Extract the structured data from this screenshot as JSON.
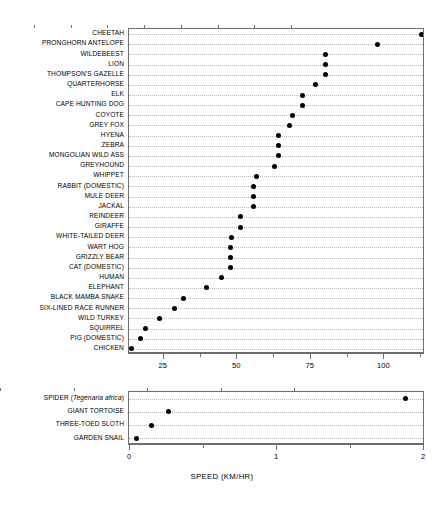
{
  "chart_data": {
    "type": "scatter",
    "title": "",
    "xlabel": "SPEED (KM/HR)",
    "ylabel": "",
    "grid": true,
    "legend": "none",
    "panels": [
      {
        "name": "fast-animals-panel",
        "xlim": [
          13.5,
          113.5
        ],
        "ticks_major": [
          25,
          50,
          75,
          100
        ],
        "ticks_minor": [
          12.5,
          37.5,
          62.5,
          87.5,
          112.5
        ],
        "tick_labels": [
          "25",
          "50",
          "75",
          "100"
        ],
        "categories": [
          "CHEETAH",
          "PRONGHORN ANTELOPE",
          "WILDEBEEST",
          "LION",
          "THOMPSON'S GAZELLE",
          "QUARTERHORSE",
          "ELK",
          "CAPE HUNTING DOG",
          "COYOTE",
          "GREY FOX",
          "HYENA",
          "ZEBRA",
          "MONGOLIAN WILD ASS",
          "GREYHOUND",
          "WHIPPET",
          "RABBIT (DOMESTIC)",
          "MULE DEER",
          "JACKAL",
          "REINDEER",
          "GIRAFFE",
          "WHITE-TAILED DEER",
          "WART HOG",
          "GRIZZLY BEAR",
          "CAT (DOMESTIC)",
          "HUMAN",
          "ELEPHANT",
          "BLACK MAMBA SNAKE",
          "SIX-LINED RACE RUNNER",
          "WILD TURKEY",
          "SQUIRREL",
          "PIG (DOMESTIC)",
          "CHICKEN"
        ],
        "values": [
          113.0,
          98.0,
          80.5,
          80.5,
          80.5,
          77.0,
          72.5,
          72.5,
          69.0,
          68.0,
          64.5,
          64.5,
          64.5,
          63.0,
          57.0,
          56.0,
          56.0,
          56.0,
          51.5,
          51.5,
          48.5,
          48.0,
          48.0,
          48.0,
          45.0,
          40.0,
          32.0,
          29.0,
          24.0,
          19.0,
          17.5,
          14.5
        ]
      },
      {
        "name": "slow-animals-panel",
        "xlim": [
          0,
          2
        ],
        "ticks_major": [
          0,
          1,
          2
        ],
        "ticks_minor": [
          0.5,
          1.5
        ],
        "tick_labels": [
          "0",
          "1",
          "2"
        ],
        "categories": [
          "SPIDER (Tegenaria africa)",
          "GIANT TORTOISE",
          "THREE-TOED SLOTH",
          "GARDEN SNAIL"
        ],
        "categories_italic_part": [
          "Tegenaria africa",
          "",
          "",
          ""
        ],
        "values": [
          1.88,
          0.27,
          0.15,
          0.05
        ]
      }
    ]
  },
  "colors": {
    "marker": "#000000",
    "axis": "#6e6e6e",
    "grid": "#b9b9b9",
    "background": "#ffffff"
  }
}
